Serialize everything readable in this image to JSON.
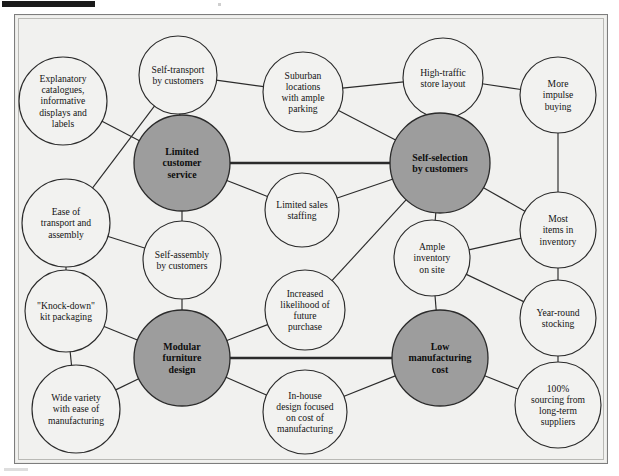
{
  "figure": {
    "type": "activity-system-map",
    "caption": "",
    "background_color": "#f1f1ef",
    "hub_fill_color": "#9d9d9d",
    "node_fill_color": "#f2f2f0",
    "line_color": "#2b2b2b"
  },
  "nodes": [
    {
      "id": "explanatory-catalogues",
      "label": "Explanatory catalogues, informative displays and labels",
      "lines": [
        "Explanatory",
        "catalogues,",
        "informative",
        "displays and",
        "labels"
      ],
      "kind": "satellite",
      "cx": 63,
      "cy": 101,
      "r": 44
    },
    {
      "id": "self-transport-by-customers",
      "label": "Self-transport by customers",
      "lines": [
        "Self-transport",
        "by customers"
      ],
      "kind": "satellite",
      "cx": 178,
      "cy": 75,
      "r": 39
    },
    {
      "id": "suburban-locations",
      "label": "Suburban locations with ample parking",
      "lines": [
        "Suburban",
        "locations",
        "with ample",
        "parking"
      ],
      "kind": "satellite",
      "cx": 303,
      "cy": 92,
      "r": 40
    },
    {
      "id": "high-traffic-store-layout",
      "label": "High-traffic store layout",
      "lines": [
        "High-traffic",
        "store layout"
      ],
      "kind": "satellite",
      "cx": 443,
      "cy": 78,
      "r": 40
    },
    {
      "id": "more-impulse-buying",
      "label": "More impulse buying",
      "lines": [
        "More",
        "impulse",
        "buying"
      ],
      "kind": "satellite",
      "cx": 558,
      "cy": 95,
      "r": 38
    },
    {
      "id": "limited-customer-service",
      "label": "Limited customer service",
      "lines": [
        "Limited",
        "customer",
        "service"
      ],
      "kind": "hub",
      "cx": 182,
      "cy": 163,
      "r": 48
    },
    {
      "id": "self-selection-by-customers",
      "label": "Self-selection by customers",
      "lines": [
        "Self-selection",
        "by customers"
      ],
      "kind": "hub",
      "cx": 440,
      "cy": 163,
      "r": 50
    },
    {
      "id": "limited-sales-staffing",
      "label": "Limited sales staffing",
      "lines": [
        "Limited sales",
        "staffing"
      ],
      "kind": "satellite",
      "cx": 302,
      "cy": 210,
      "r": 37
    },
    {
      "id": "ease-of-transport-and-assembly",
      "label": "Ease of transport and assembly",
      "lines": [
        "Ease of",
        "transport and",
        "assembly"
      ],
      "kind": "satellite",
      "cx": 66,
      "cy": 223,
      "r": 44
    },
    {
      "id": "self-assembly-by-customers",
      "label": "Self-assembly by customers",
      "lines": [
        "Self-assembly",
        "by customers"
      ],
      "kind": "satellite",
      "cx": 182,
      "cy": 260,
      "r": 39
    },
    {
      "id": "ample-inventory-on-site",
      "label": "Ample inventory on site",
      "lines": [
        "Ample",
        "inventory",
        "on site"
      ],
      "kind": "satellite",
      "cx": 432,
      "cy": 258,
      "r": 38
    },
    {
      "id": "most-items-in-inventory",
      "label": "Most items in inventory",
      "lines": [
        "Most",
        "items in",
        "inventory"
      ],
      "kind": "satellite",
      "cx": 558,
      "cy": 230,
      "r": 38
    },
    {
      "id": "knock-down-kit-packaging",
      "label": "\"Knock-down\" kit packaging",
      "lines": [
        "\"Knock-down\"",
        "kit packaging"
      ],
      "kind": "satellite",
      "cx": 66,
      "cy": 311,
      "r": 41
    },
    {
      "id": "increased-likelihood-of-future-purchase",
      "label": "Increased likelihood of future purchase",
      "lines": [
        "Increased",
        "likelihood of",
        "future",
        "purchase"
      ],
      "kind": "satellite",
      "cx": 305,
      "cy": 310,
      "r": 40
    },
    {
      "id": "year-round-stocking",
      "label": "Year-round stocking",
      "lines": [
        "Year-round",
        "stocking"
      ],
      "kind": "satellite",
      "cx": 558,
      "cy": 318,
      "r": 38
    },
    {
      "id": "modular-furniture-design",
      "label": "Modular furniture design",
      "lines": [
        "Modular",
        "furniture",
        "design"
      ],
      "kind": "hub",
      "cx": 182,
      "cy": 358,
      "r": 48
    },
    {
      "id": "low-manufacturing-cost",
      "label": "Low manufacturing cost",
      "lines": [
        "Low",
        "manufacturing",
        "cost"
      ],
      "kind": "hub",
      "cx": 440,
      "cy": 358,
      "r": 48
    },
    {
      "id": "wide-variety-with-ease-of-manufacturing",
      "label": "Wide variety with ease of manufacturing",
      "lines": [
        "Wide variety",
        "with ease of",
        "manufacturing"
      ],
      "kind": "satellite",
      "cx": 76,
      "cy": 409,
      "r": 44
    },
    {
      "id": "in-house-design-focused-on-cost",
      "label": "In-house design focused on cost of manufacturing",
      "lines": [
        "In-house",
        "design focused",
        "on cost of",
        "manufacturing"
      ],
      "kind": "satellite",
      "cx": 305,
      "cy": 412,
      "r": 42
    },
    {
      "id": "sourcing-from-long-term-suppliers",
      "label": "100% sourcing from long-term suppliers",
      "lines": [
        "100%",
        "sourcing from",
        "long-term",
        "suppliers"
      ],
      "kind": "satellite",
      "cx": 558,
      "cy": 405,
      "r": 43
    }
  ],
  "edges": [
    {
      "from": "explanatory-catalogues",
      "to": "limited-customer-service",
      "weight": "normal"
    },
    {
      "from": "self-transport-by-customers",
      "to": "limited-customer-service",
      "weight": "normal"
    },
    {
      "from": "self-transport-by-customers",
      "to": "suburban-locations",
      "weight": "normal"
    },
    {
      "from": "self-transport-by-customers",
      "to": "ease-of-transport-and-assembly",
      "weight": "normal"
    },
    {
      "from": "suburban-locations",
      "to": "high-traffic-store-layout",
      "weight": "normal"
    },
    {
      "from": "suburban-locations",
      "to": "self-selection-by-customers",
      "weight": "normal"
    },
    {
      "from": "high-traffic-store-layout",
      "to": "more-impulse-buying",
      "weight": "normal"
    },
    {
      "from": "high-traffic-store-layout",
      "to": "self-selection-by-customers",
      "weight": "normal"
    },
    {
      "from": "more-impulse-buying",
      "to": "most-items-in-inventory",
      "weight": "normal"
    },
    {
      "from": "limited-customer-service",
      "to": "self-selection-by-customers",
      "weight": "thick"
    },
    {
      "from": "limited-customer-service",
      "to": "limited-sales-staffing",
      "weight": "normal"
    },
    {
      "from": "limited-customer-service",
      "to": "self-assembly-by-customers",
      "weight": "normal"
    },
    {
      "from": "limited-sales-staffing",
      "to": "self-selection-by-customers",
      "weight": "normal"
    },
    {
      "from": "ease-of-transport-and-assembly",
      "to": "self-assembly-by-customers",
      "weight": "normal"
    },
    {
      "from": "ease-of-transport-and-assembly",
      "to": "knock-down-kit-packaging",
      "weight": "normal"
    },
    {
      "from": "self-assembly-by-customers",
      "to": "modular-furniture-design",
      "weight": "normal"
    },
    {
      "from": "self-selection-by-customers",
      "to": "ample-inventory-on-site",
      "weight": "normal"
    },
    {
      "from": "self-selection-by-customers",
      "to": "most-items-in-inventory",
      "weight": "normal"
    },
    {
      "from": "self-selection-by-customers",
      "to": "increased-likelihood-of-future-purchase",
      "weight": "normal"
    },
    {
      "from": "ample-inventory-on-site",
      "to": "most-items-in-inventory",
      "weight": "normal"
    },
    {
      "from": "ample-inventory-on-site",
      "to": "year-round-stocking",
      "weight": "normal"
    },
    {
      "from": "ample-inventory-on-site",
      "to": "low-manufacturing-cost",
      "weight": "normal"
    },
    {
      "from": "most-items-in-inventory",
      "to": "year-round-stocking",
      "weight": "normal"
    },
    {
      "from": "year-round-stocking",
      "to": "sourcing-from-long-term-suppliers",
      "weight": "normal"
    },
    {
      "from": "knock-down-kit-packaging",
      "to": "modular-furniture-design",
      "weight": "normal"
    },
    {
      "from": "knock-down-kit-packaging",
      "to": "wide-variety-with-ease-of-manufacturing",
      "weight": "normal"
    },
    {
      "from": "increased-likelihood-of-future-purchase",
      "to": "modular-furniture-design",
      "weight": "normal"
    },
    {
      "from": "modular-furniture-design",
      "to": "low-manufacturing-cost",
      "weight": "thick"
    },
    {
      "from": "modular-furniture-design",
      "to": "wide-variety-with-ease-of-manufacturing",
      "weight": "normal"
    },
    {
      "from": "modular-furniture-design",
      "to": "in-house-design-focused-on-cost",
      "weight": "normal"
    },
    {
      "from": "in-house-design-focused-on-cost",
      "to": "low-manufacturing-cost",
      "weight": "normal"
    },
    {
      "from": "low-manufacturing-cost",
      "to": "sourcing-from-long-term-suppliers",
      "weight": "normal"
    }
  ]
}
